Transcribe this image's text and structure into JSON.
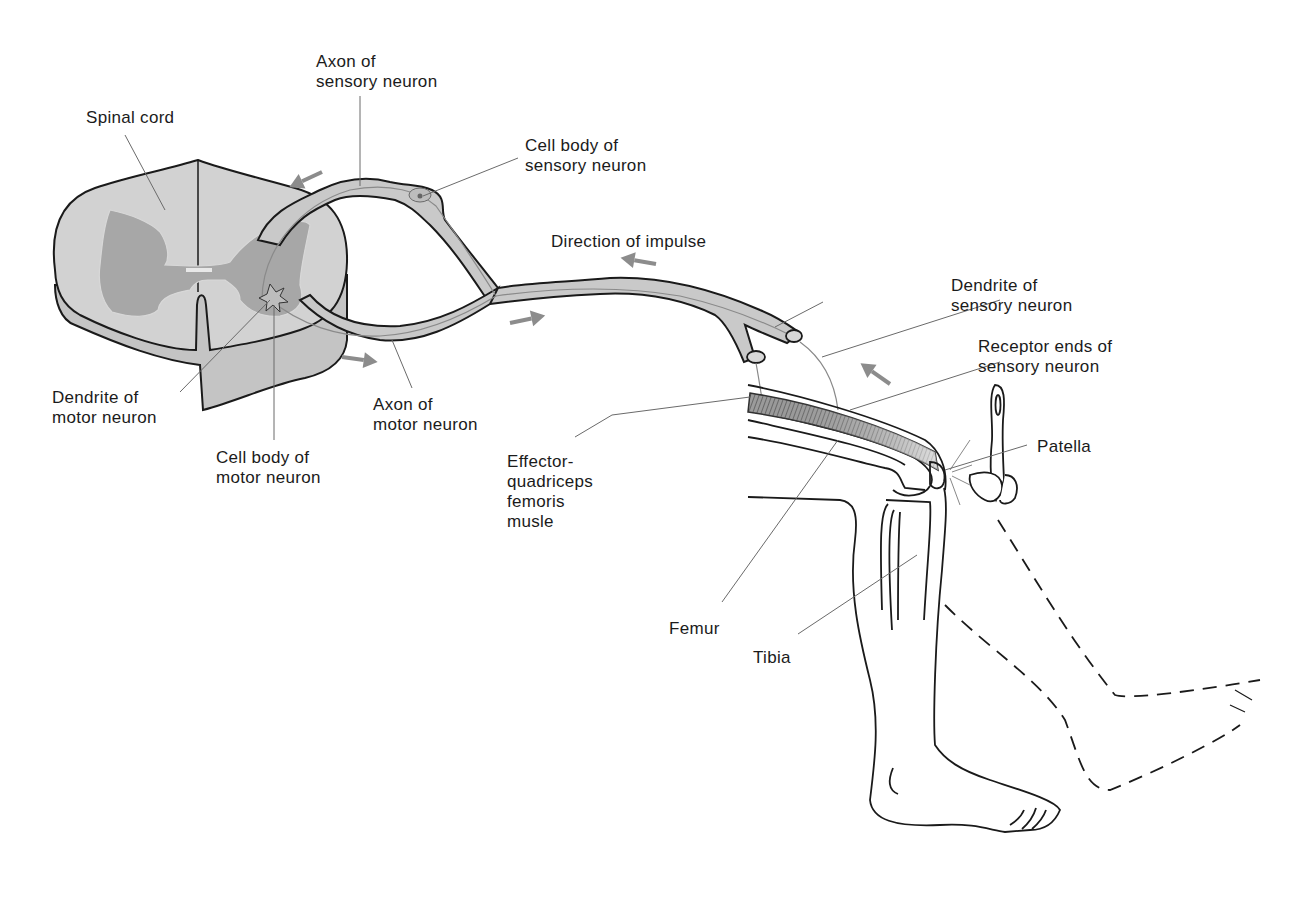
{
  "figure": {
    "colors": {
      "nerve_fill": "#c9c9c9",
      "spinal_cord_fill": "#cfcfcf",
      "gray_matter_fill": "#a9a9a9",
      "arrow": "#8c8c8c",
      "outline": "#1a1a1a",
      "leader_line": "#7a7a7a",
      "background": "#ffffff"
    }
  },
  "labels": {
    "spinal_cord": [
      "Spinal cord"
    ],
    "axon_sensory": [
      "Axon of",
      "sensory neuron"
    ],
    "cell_body_sensory": [
      "Cell body of",
      "sensory neuron"
    ],
    "direction_impulse": [
      "Direction of impulse"
    ],
    "dendrite_sensory": [
      "Dendrite of",
      "sensory neuron"
    ],
    "receptor_ends": [
      "Receptor ends of",
      "sensory neuron"
    ],
    "patella": [
      "Patella"
    ],
    "dendrite_motor": [
      "Dendrite of",
      "motor neuron"
    ],
    "cell_body_motor": [
      "Cell body of",
      "motor neuron"
    ],
    "axon_motor": [
      "Axon of",
      "motor neuron"
    ],
    "effector": [
      "Effector-",
      "quadriceps",
      "femoris",
      "musle"
    ],
    "femur": [
      "Femur"
    ],
    "tibia": [
      "Tibia"
    ]
  },
  "arrows": [
    {
      "name": "arrow-sensory-axon",
      "direction": "toward spinal cord"
    },
    {
      "name": "arrow-impulse-sensory",
      "direction": "left"
    },
    {
      "name": "arrow-dendrite-sensory",
      "direction": "up-left"
    },
    {
      "name": "arrow-motor-axon-1",
      "direction": "right"
    },
    {
      "name": "arrow-motor-axon-2",
      "direction": "right"
    }
  ]
}
